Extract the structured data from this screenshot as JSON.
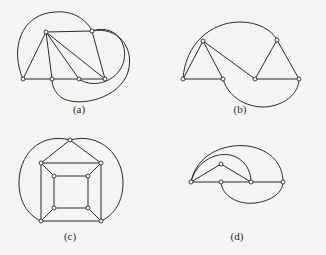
{
  "figure": {
    "panels": [
      {
        "id": "a",
        "label": "(a)",
        "caption_x": 79,
        "caption_y": 106
      },
      {
        "id": "b",
        "label": "(b)",
        "caption_x": 240,
        "caption_y": 106
      },
      {
        "id": "c",
        "label": "(c)",
        "caption_x": 70,
        "caption_y": 233
      },
      {
        "id": "d",
        "label": "(d)",
        "caption_x": 238,
        "caption_y": 233
      }
    ]
  },
  "colors": {
    "line": "#2a2a2a",
    "background": "#f4f4f2",
    "vertex_fill": "#fafafa"
  }
}
